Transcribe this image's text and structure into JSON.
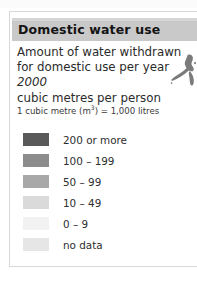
{
  "panel": {
    "title": "Domestic water use",
    "title_bar_color": "#c9c9c9",
    "border_color": "#d8d8d8",
    "background_color": "#ffffff"
  },
  "description": {
    "line1": "Amount of water withdrawn",
    "line2": "for domestic use per year",
    "year": "2000",
    "line4": "cubic metres per person"
  },
  "footnote": {
    "prefix": "1 cubic metre (m",
    "superscript": "3",
    "suffix": ") = 1,000 litres",
    "full": "1 cubic metre (m3) = 1,000 litres"
  },
  "legend": {
    "units": "cubic metres per person",
    "items": [
      {
        "label": "200 or more",
        "color": "#595959",
        "value_min": 200,
        "value_max": null
      },
      {
        "label": "100 – 199",
        "color": "#8c8c8c",
        "value_min": 100,
        "value_max": 199
      },
      {
        "label": "50 – 99",
        "color": "#a8a8a8",
        "value_min": 50,
        "value_max": 99
      },
      {
        "label": "10 – 49",
        "color": "#dadada",
        "value_min": 10,
        "value_max": 49
      },
      {
        "label": "0 – 9",
        "color": "#f2f2f2",
        "value_min": 0,
        "value_max": 9
      },
      {
        "label": "no data",
        "color": "#e6e6e6",
        "value_min": null,
        "value_max": null
      }
    ]
  },
  "map_fragment": {
    "name": "landmass-outline",
    "fill_color": "#7b7b7b"
  }
}
